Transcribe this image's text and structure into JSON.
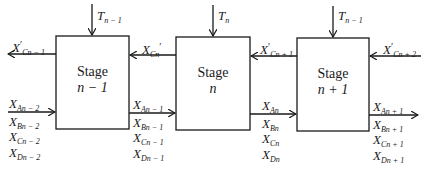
{
  "diagram": {
    "type": "multistage cascade block diagram",
    "stages": [
      {
        "id": "stage-n-1",
        "title": "Stage",
        "index": "n − 1",
        "top_input": {
          "base": "T",
          "sub": "n − 1"
        }
      },
      {
        "id": "stage-n",
        "title": "Stage",
        "index": "n",
        "top_input": {
          "base": "T",
          "sub": "n"
        }
      },
      {
        "id": "stage-n+1",
        "title": "Stage",
        "index": "n + 1",
        "top_input": {
          "base": "T",
          "sub": "n − 1"
        }
      }
    ],
    "upper_stream": [
      {
        "base": "X",
        "prime": "′",
        "sub": "Cn − 1",
        "direction": "out-left-of-stage-n-1"
      },
      {
        "base": "X",
        "prime": "′",
        "sub": "Cn",
        "direction": "stage-n-to-stage-n-1"
      },
      {
        "base": "X",
        "prime": "′",
        "sub": "Cn + 1",
        "direction": "stage-n+1-to-stage-n"
      },
      {
        "base": "X",
        "prime": "′",
        "sub": "Cn + 2",
        "direction": "into-stage-n+1-from-right"
      }
    ],
    "lower_stream_groups": [
      {
        "position": "input-stage-n-1",
        "labels": [
          {
            "base": "X",
            "sub": "An − 2"
          },
          {
            "base": "X",
            "sub": "Bn − 2"
          },
          {
            "base": "X",
            "sub": "Cn − 2"
          },
          {
            "base": "X",
            "sub": "Dn − 2"
          }
        ]
      },
      {
        "position": "between-n-1-and-n",
        "labels": [
          {
            "base": "X",
            "sub": "An − 1"
          },
          {
            "base": "X",
            "sub": "Bn − 1"
          },
          {
            "base": "X",
            "sub": "Cn − 1"
          },
          {
            "base": "X",
            "sub": "Dn − 1"
          }
        ]
      },
      {
        "position": "between-n-and-n+1",
        "labels": [
          {
            "base": "X",
            "sub": "An"
          },
          {
            "base": "X",
            "sub": "Bn"
          },
          {
            "base": "X",
            "sub": "Cn"
          },
          {
            "base": "X",
            "sub": "Dn"
          }
        ]
      },
      {
        "position": "output-stage-n+1",
        "labels": [
          {
            "base": "X",
            "sub": "An + 1"
          },
          {
            "base": "X",
            "sub": "Bn + 1"
          },
          {
            "base": "X",
            "sub": "Cn + 1"
          },
          {
            "base": "X",
            "sub": "Dn + 1"
          }
        ]
      }
    ],
    "colors": {
      "line": "#1a1a1a",
      "background": "#ffffff"
    }
  }
}
